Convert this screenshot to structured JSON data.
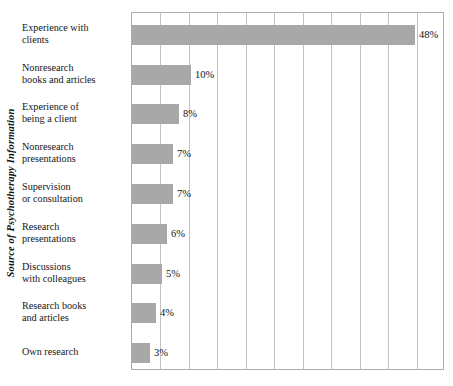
{
  "chart_data": {
    "type": "bar",
    "orientation": "horizontal",
    "title": "",
    "xlabel": "",
    "ylabel": "Source of Psychotherapy Information",
    "categories": [
      "Experience with\nclients",
      "Nonresearch\nbooks and articles",
      "Experience of\nbeing a client",
      "Nonresearch\npresentations",
      "Supervision\nor consultation",
      "Research\npresentations",
      "Discussions\nwith colleagues",
      "Research books\nand articles",
      "Own research"
    ],
    "values": [
      48,
      10,
      8,
      7,
      7,
      6,
      5,
      4,
      3
    ],
    "value_labels": [
      "48%",
      "10%",
      "8%",
      "7%",
      "7%",
      "6%",
      "5%",
      "4%",
      "3%"
    ],
    "xlim": [
      0,
      53
    ],
    "grid": true,
    "gridlines_count": 10,
    "legend": "none",
    "bar_color": "#a8a8a8",
    "grid_color": "#c2c2c2",
    "axis_color": "#adadad",
    "x_tick_labels": []
  }
}
